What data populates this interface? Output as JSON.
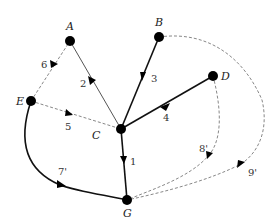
{
  "diagram": {
    "type": "directed-graph",
    "colors": {
      "background": "#ffffff",
      "node": "#000000",
      "solid_edge": "#111111",
      "thin_edge": "#555555",
      "dashed_edge": "#888888"
    },
    "nodes": [
      {
        "id": "A",
        "label": "A",
        "x": 70,
        "y": 41,
        "lx": 66,
        "ly": 30
      },
      {
        "id": "B",
        "label": "B",
        "x": 159,
        "y": 37,
        "lx": 155,
        "ly": 26
      },
      {
        "id": "D",
        "label": "D",
        "x": 213,
        "y": 76,
        "lx": 221,
        "ly": 80
      },
      {
        "id": "E",
        "label": "E",
        "x": 31,
        "y": 101,
        "lx": 16,
        "ly": 105
      },
      {
        "id": "C",
        "label": "C",
        "x": 121,
        "y": 129,
        "lx": 92,
        "ly": 139
      },
      {
        "id": "G",
        "label": "G",
        "x": 127,
        "y": 200,
        "lx": 123,
        "ly": 217
      }
    ],
    "edges": [
      {
        "from": "A",
        "to": "C",
        "label": "2",
        "style": "thin",
        "lx": 80,
        "ly": 87
      },
      {
        "from": "B",
        "to": "C",
        "label": "3",
        "style": "solid",
        "lx": 151,
        "ly": 82
      },
      {
        "from": "D",
        "to": "C",
        "label": "4",
        "style": "solid",
        "lx": 163,
        "ly": 121
      },
      {
        "from": "C",
        "to": "G",
        "label": "1",
        "style": "solid",
        "lx": 130,
        "ly": 165
      },
      {
        "from": "E",
        "to": "A",
        "label": "6",
        "style": "dashed",
        "lx": 41,
        "ly": 68
      },
      {
        "from": "E",
        "to": "C",
        "label": "5",
        "style": "dashed",
        "lx": 65,
        "ly": 130
      },
      {
        "from": "E",
        "to": "G",
        "label": "7'",
        "style": "solid-curve",
        "lx": 58,
        "ly": 175
      },
      {
        "from": "D",
        "to": "G",
        "label": "8'",
        "style": "dashed-curve",
        "lx": 199,
        "ly": 152
      },
      {
        "from": "B",
        "to": "G",
        "label": "9'",
        "style": "dashed-curve",
        "lx": 248,
        "ly": 176
      }
    ]
  }
}
